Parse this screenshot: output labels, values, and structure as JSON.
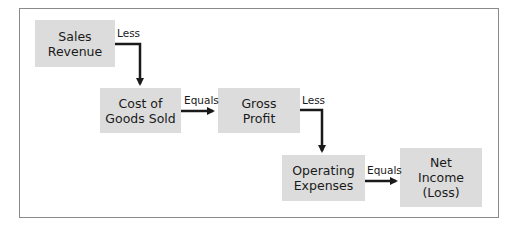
{
  "diagram": {
    "nodes": [
      {
        "id": "sales-revenue",
        "label": "Sales\nRevenue"
      },
      {
        "id": "cogs",
        "label": "Cost of\nGoods Sold"
      },
      {
        "id": "gross-profit",
        "label": "Gross\nProfit"
      },
      {
        "id": "operating-expenses",
        "label": "Operating\nExpenses"
      },
      {
        "id": "net-income",
        "label": "Net\nIncome\n(Loss)"
      }
    ],
    "edges": [
      {
        "from": "sales-revenue",
        "to": "cogs",
        "label": "Less"
      },
      {
        "from": "cogs",
        "to": "gross-profit",
        "label": "Equals"
      },
      {
        "from": "gross-profit",
        "to": "operating-expenses",
        "label": "Less"
      },
      {
        "from": "operating-expenses",
        "to": "net-income",
        "label": "Equals"
      }
    ],
    "colors": {
      "box_fill": "#dcdcdc",
      "arrow": "#1a1a1a",
      "frame": "#8a8a8a"
    }
  }
}
